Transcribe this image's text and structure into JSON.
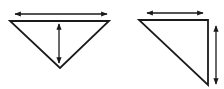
{
  "figure": {
    "stroke_color": "#1a1a1a",
    "background": "#ffffff",
    "shapes": [
      {
        "id": "inverted-triangle",
        "points": [
          [
            10,
            21
          ],
          [
            109,
            21
          ],
          [
            60,
            68
          ]
        ],
        "arrows": [
          {
            "id": "width",
            "orientation": "horizontal",
            "from": [
              15,
              14
            ],
            "to": [
              107,
              14
            ]
          },
          {
            "id": "height",
            "orientation": "vertical",
            "from": [
              59,
              24
            ],
            "to": [
              59,
              63
            ]
          }
        ]
      },
      {
        "id": "right-triangle",
        "points": [
          [
            139,
            20
          ],
          [
            208,
            20
          ],
          [
            208,
            85
          ]
        ],
        "arrows": [
          {
            "id": "width",
            "orientation": "horizontal",
            "from": [
              147,
              13
            ],
            "to": [
              203,
              13
            ]
          },
          {
            "id": "height",
            "orientation": "vertical",
            "from": [
              216,
              26
            ],
            "to": [
              216,
              84
            ]
          }
        ]
      }
    ]
  }
}
